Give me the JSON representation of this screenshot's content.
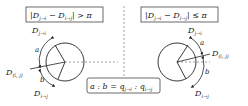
{
  "left_panel": {
    "condition": "|D_{j→i} − D_{i→j}| > π",
    "cond_parts": {
      "bar1": "|",
      "D1": "D",
      "s1": "j→i",
      "minus": " − ",
      "D2": "D",
      "s2": "i→j",
      "bar2": "|",
      "rel": " > π"
    },
    "labels": {
      "d_ji": {
        "D": "D",
        "sub": "j→i"
      },
      "d_ij": {
        "D": "D",
        "sub": "i→j"
      },
      "d_i_j": {
        "D": "D",
        "sub": "(i, j)"
      },
      "a": "a",
      "b": "b"
    }
  },
  "right_panel": {
    "condition": "|D_{j→i} − D_{i→j}| ≤ π",
    "cond_parts": {
      "bar1": "|",
      "D1": "D",
      "s1": "j→i",
      "minus": " − ",
      "D2": "D",
      "s2": "i→j",
      "bar2": "|",
      "rel": " ≤ π"
    },
    "labels": {
      "d_ji": {
        "D": "D",
        "sub": "j→i"
      },
      "d_ij": {
        "D": "D",
        "sub": "i→j"
      },
      "d_i_j": {
        "D": "D",
        "sub": "(i, j)"
      },
      "a": "a",
      "b": "b"
    }
  },
  "ratio": {
    "a": "a",
    "sep1": " : ",
    "b": "b",
    "eq": " = ",
    "q1": "q",
    "s1": "j→i",
    "sep2": " : ",
    "q2": "q",
    "s2": "i→j"
  },
  "colors": {
    "line": "#222222",
    "dashed": "#888888",
    "box_border": "#444444"
  }
}
